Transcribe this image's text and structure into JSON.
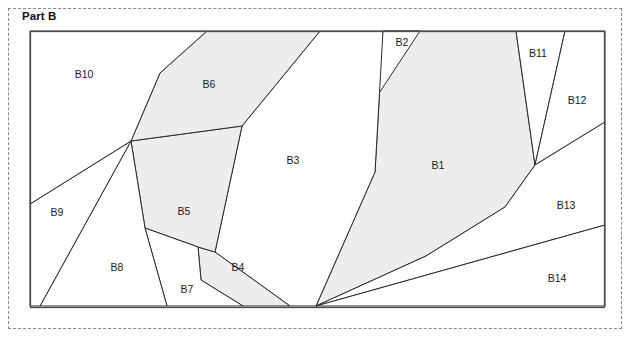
{
  "page": {
    "title": "Part B",
    "frame_style": "dashed",
    "frame_color": "#8a8a8a",
    "background": "#ffffff"
  },
  "figure": {
    "outline_color": "#4d4d4d",
    "line_color": "#2b2b2b",
    "shaded_fill": "#ededed",
    "unshaded_fill": "#ffffff",
    "bounds": {
      "x": 30,
      "y": 31,
      "width": 575,
      "height": 277
    },
    "regions": [
      {
        "id": "B1",
        "label": "B1",
        "shaded": true,
        "fill": "#ededed",
        "label_pos": {
          "x": 438,
          "y": 166
        },
        "points": "420,31 516,31 535,165 505,207 426,256 316,306 375,172 383,31"
      },
      {
        "id": "B2",
        "label": "B2",
        "shaded": false,
        "fill": "#ffffff",
        "label_pos": {
          "x": 402,
          "y": 43
        },
        "points": "383,31 420,31 366,113"
      },
      {
        "id": "B3",
        "label": "B3",
        "shaded": false,
        "fill": "#ffffff",
        "label_pos": {
          "x": 293,
          "y": 161
        },
        "points": "320,31 383,31 375,172 316,306 290,306 215,252 242,126"
      },
      {
        "id": "B4",
        "label": "B4",
        "shaded": true,
        "fill": "#ededed",
        "label_pos": {
          "x": 238,
          "y": 268
        },
        "points": "215,252 290,306 243,306 201,280 198,247"
      },
      {
        "id": "B5",
        "label": "B5",
        "shaded": true,
        "fill": "#ededed",
        "label_pos": {
          "x": 184,
          "y": 212
        },
        "points": "131,141 242,126 215,252 198,247 145,228"
      },
      {
        "id": "B6",
        "label": "B6",
        "shaded": true,
        "fill": "#ededed",
        "label_pos": {
          "x": 209,
          "y": 85
        },
        "points": "207,31 320,31 242,126 131,141 160,73"
      },
      {
        "id": "B7",
        "label": "B7",
        "shaded": false,
        "fill": "#ffffff",
        "label_pos": {
          "x": 187,
          "y": 290
        },
        "points": "145,228 198,247 201,280 243,306 167,306"
      },
      {
        "id": "B8",
        "label": "B8",
        "shaded": false,
        "fill": "#ffffff",
        "label_pos": {
          "x": 117,
          "y": 268
        },
        "points": "131,141 145,228 167,306 40,306"
      },
      {
        "id": "B9",
        "label": "B9",
        "shaded": false,
        "fill": "#ffffff",
        "label_pos": {
          "x": 57,
          "y": 213
        },
        "points": "30,204 131,141 40,306 30,306"
      },
      {
        "id": "B10",
        "label": "B10",
        "shaded": false,
        "fill": "#ffffff",
        "label_pos": {
          "x": 84,
          "y": 75
        },
        "points": "30,31 207,31 160,73 131,141 30,204"
      },
      {
        "id": "B11",
        "label": "B11",
        "shaded": false,
        "fill": "#ffffff",
        "label_pos": {
          "x": 538,
          "y": 54
        },
        "points": "516,31 565,31 535,165"
      },
      {
        "id": "B12",
        "label": "B12",
        "shaded": false,
        "fill": "#ffffff",
        "label_pos": {
          "x": 577,
          "y": 101
        },
        "points": "565,31 605,31 605,122 535,165"
      },
      {
        "id": "B13",
        "label": "B13",
        "shaded": false,
        "fill": "#ffffff",
        "label_pos": {
          "x": 566,
          "y": 206
        },
        "points": "605,122 605,225 316,306 426,256 505,207 535,165"
      },
      {
        "id": "B14",
        "label": "B14",
        "shaded": false,
        "fill": "#ffffff",
        "label_pos": {
          "x": 557,
          "y": 279
        },
        "points": "605,225 605,306 316,306"
      }
    ]
  }
}
